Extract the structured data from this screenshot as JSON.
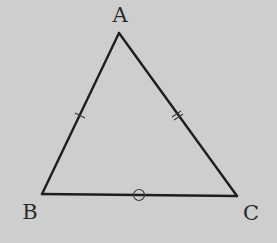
{
  "diagram": {
    "type": "triangle",
    "background_color": "#cecece",
    "stroke_color": "#1e1e1e",
    "vertices": [
      {
        "id": "A",
        "label": "A",
        "x": 119,
        "y": 33,
        "label_x": 120,
        "label_y": 22
      },
      {
        "id": "B",
        "label": "B",
        "x": 42,
        "y": 194,
        "label_x": 30,
        "label_y": 219
      },
      {
        "id": "C",
        "label": "C",
        "x": 237,
        "y": 196,
        "label_x": 250,
        "label_y": 220
      }
    ],
    "sides": [
      {
        "from": "A",
        "to": "B",
        "mark": "single-tick"
      },
      {
        "from": "A",
        "to": "C",
        "mark": "double-tick"
      },
      {
        "from": "B",
        "to": "C",
        "mark": "circle"
      }
    ]
  }
}
